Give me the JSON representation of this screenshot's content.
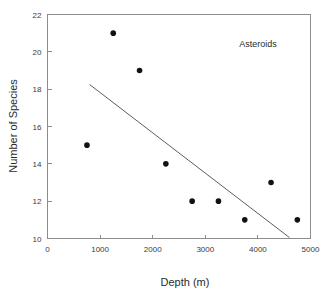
{
  "chart_data": {
    "type": "scatter",
    "title": "",
    "annotation": "Asteroids",
    "xlabel": "Depth (m)",
    "ylabel": "Number of Species",
    "xlim": [
      0,
      5000
    ],
    "ylim": [
      10,
      22
    ],
    "xticks": [
      0,
      1000,
      2000,
      3000,
      4000,
      5000
    ],
    "yticks": [
      10,
      12,
      14,
      16,
      18,
      20,
      22
    ],
    "xtick_labels": [
      "0",
      "1000",
      "2000",
      "3000",
      "4000",
      "5000"
    ],
    "ytick_labels": [
      "10",
      "12",
      "14",
      "16",
      "18",
      "20",
      "22"
    ],
    "grid": false,
    "legend": "none",
    "marker": "filled-circle",
    "marker_color": "#121212",
    "line_color": "#4a4a4a",
    "background_color": "#ffffff",
    "axis_color": "#8c8c8c",
    "points": [
      {
        "x": 750,
        "y": 15
      },
      {
        "x": 1250,
        "y": 21
      },
      {
        "x": 1750,
        "y": 19
      },
      {
        "x": 2250,
        "y": 14
      },
      {
        "x": 2750,
        "y": 12
      },
      {
        "x": 3250,
        "y": 12
      },
      {
        "x": 3750,
        "y": 11
      },
      {
        "x": 4250,
        "y": 13
      },
      {
        "x": 4750,
        "y": 11
      }
    ],
    "x": [
      750,
      1250,
      1750,
      2250,
      2750,
      3250,
      3750,
      4250,
      4750
    ],
    "values": [
      15,
      21,
      19,
      14,
      12,
      12,
      11,
      13,
      11
    ],
    "trendline": {
      "type": "linear-fit",
      "x_start": 800,
      "y_start": 18.25,
      "x_end": 4600,
      "y_end": 10.05
    }
  }
}
